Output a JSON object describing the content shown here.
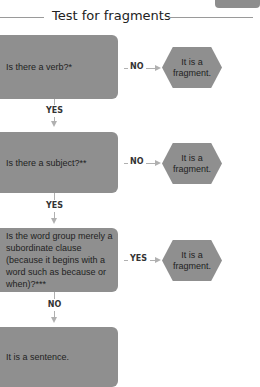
{
  "title": "Test for fragments",
  "colors": {
    "box_fill": "#8f8f8f",
    "arrow": "#b0b0b0",
    "rule": "#9a9a9a"
  },
  "steps": [
    {
      "question": "Is there a verb?*",
      "branch_label": "NO",
      "result": "It is a fragment.",
      "down_label": "YES"
    },
    {
      "question": "Is there a subject?**",
      "branch_label": "NO",
      "result": "It is a fragment.",
      "down_label": "YES"
    },
    {
      "question": "Is the word group merely a subordinate clause (because it begins with a word such as because or when)?***",
      "branch_label": "YES",
      "result": "It is a fragment.",
      "down_label": "NO"
    }
  ],
  "final": "It is a sentence."
}
